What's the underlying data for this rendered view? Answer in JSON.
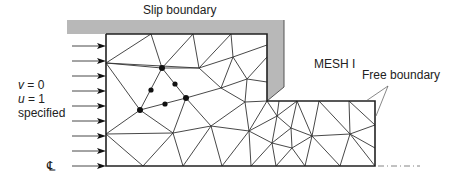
{
  "diagram": {
    "title": "MESH I",
    "labels": {
      "slip_boundary": "Slip boundary",
      "free_boundary": "Free boundary",
      "mesh_name": "MESH I",
      "inlet_v_var": "v",
      "inlet_v_eq": " = 0",
      "inlet_u_var": "u",
      "inlet_u_eq": " = 1",
      "inlet_specified": "specified",
      "centerline": "℄"
    },
    "colors": {
      "mesh_line": "#333333",
      "boundary_line": "#222222",
      "slip_fill": "#b8b8b8",
      "node_fill": "#111111",
      "centerline_dash": "#666666"
    },
    "inlet_arrows_y": [
      46,
      61,
      76,
      91,
      106,
      121,
      136,
      151,
      166
    ],
    "nodes": {
      "big": [
        [
          162,
          68
        ],
        [
          140,
          110
        ],
        [
          186,
          98
        ]
      ],
      "small": [
        [
          151,
          90
        ],
        [
          175,
          84
        ],
        [
          165,
          104
        ]
      ]
    },
    "edges": [
      [
        106,
        63,
        151,
        34
      ],
      [
        106,
        63,
        162,
        68
      ],
      [
        106,
        63,
        199,
        68
      ],
      [
        151,
        34,
        162,
        68
      ],
      [
        193,
        34,
        162,
        68
      ],
      [
        193,
        34,
        199,
        68
      ],
      [
        231,
        34,
        199,
        68
      ],
      [
        231,
        34,
        233,
        57
      ],
      [
        233,
        57,
        199,
        68
      ],
      [
        233,
        57,
        267,
        45
      ],
      [
        233,
        57,
        247,
        79
      ],
      [
        233,
        57,
        221,
        88
      ],
      [
        199,
        68,
        162,
        68
      ],
      [
        199,
        68,
        221,
        88
      ],
      [
        162,
        68,
        186,
        98
      ],
      [
        162,
        68,
        140,
        110
      ],
      [
        106,
        63,
        140,
        110
      ],
      [
        221,
        88,
        186,
        98
      ],
      [
        221,
        88,
        247,
        79
      ],
      [
        247,
        79,
        267,
        57
      ],
      [
        247,
        79,
        267,
        82
      ],
      [
        221,
        88,
        245,
        102
      ],
      [
        247,
        79,
        245,
        102
      ],
      [
        186,
        98,
        140,
        110
      ],
      [
        186,
        98,
        211,
        126
      ],
      [
        186,
        98,
        173,
        133
      ],
      [
        140,
        110,
        106,
        134
      ],
      [
        140,
        110,
        173,
        133
      ],
      [
        106,
        134,
        173,
        133
      ],
      [
        106,
        134,
        143,
        166
      ],
      [
        173,
        133,
        143,
        166
      ],
      [
        173,
        133,
        183,
        166
      ],
      [
        173,
        133,
        211,
        126
      ],
      [
        211,
        126,
        183,
        166
      ],
      [
        211,
        126,
        222,
        166
      ],
      [
        211,
        126,
        245,
        102
      ],
      [
        211,
        126,
        249,
        131
      ],
      [
        245,
        102,
        249,
        131
      ],
      [
        245,
        102,
        267,
        101
      ],
      [
        267,
        101,
        249,
        131
      ],
      [
        249,
        131,
        222,
        166
      ],
      [
        249,
        131,
        251,
        166
      ],
      [
        249,
        131,
        277,
        116
      ],
      [
        249,
        131,
        272,
        143
      ],
      [
        267,
        101,
        277,
        116
      ],
      [
        279,
        101,
        277,
        116
      ],
      [
        297,
        101,
        277,
        116
      ],
      [
        297,
        101,
        291,
        128
      ],
      [
        277,
        116,
        291,
        128
      ],
      [
        277,
        116,
        272,
        143
      ],
      [
        291,
        128,
        272,
        143
      ],
      [
        291,
        128,
        312,
        136
      ],
      [
        291,
        128,
        292,
        148
      ],
      [
        272,
        143,
        292,
        148
      ],
      [
        272,
        143,
        251,
        166
      ],
      [
        272,
        143,
        276,
        166
      ],
      [
        292,
        148,
        276,
        166
      ],
      [
        292,
        148,
        305,
        166
      ],
      [
        292,
        148,
        312,
        136
      ],
      [
        312,
        136,
        305,
        166
      ],
      [
        312,
        136,
        297,
        101
      ],
      [
        312,
        136,
        319,
        101
      ],
      [
        312,
        136,
        350,
        134
      ],
      [
        312,
        136,
        340,
        166
      ],
      [
        319,
        101,
        350,
        134
      ],
      [
        349,
        101,
        350,
        134
      ],
      [
        349,
        101,
        375,
        125
      ],
      [
        350,
        134,
        375,
        125
      ],
      [
        350,
        134,
        375,
        148
      ],
      [
        350,
        134,
        340,
        166
      ],
      [
        350,
        134,
        375,
        166
      ]
    ]
  }
}
